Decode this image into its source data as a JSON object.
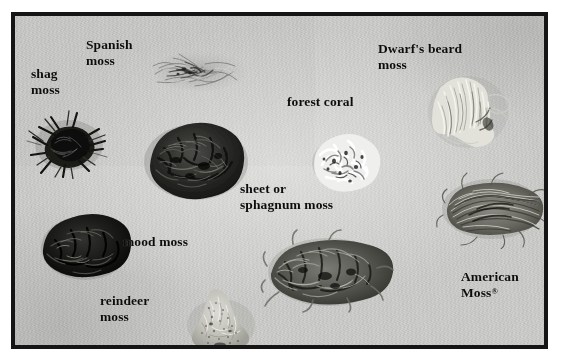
{
  "image": {
    "kind": "photograph",
    "subject": "labeled moss and preserved botanical specimens on a grey board",
    "frame_color": "#151515",
    "background_color": "#cdcdcb",
    "label_color": "#0d0d0d",
    "width": 562,
    "height": 364
  },
  "labels": [
    {
      "id": "spanish-moss",
      "text": "Spanish\nmoss"
    },
    {
      "id": "shag-moss",
      "text": "shag\nmoss"
    },
    {
      "id": "dwarfs-beard-moss",
      "text": "Dwarf's beard\nmoss"
    },
    {
      "id": "forest-coral",
      "text": "forest coral"
    },
    {
      "id": "sheet-sphagnum-moss",
      "text": "sheet or\nsphagnum moss"
    },
    {
      "id": "mood-moss",
      "text": "mood moss"
    },
    {
      "id": "reindeer-moss",
      "text": "reindeer\nmoss"
    },
    {
      "id": "american-moss",
      "text": "American\nMoss",
      "trademark": "®"
    }
  ],
  "specimens": [
    {
      "id": "spanish-moss-specimen",
      "tone": "light-grey wispy strands"
    },
    {
      "id": "shag-moss-specimen",
      "tone": "very dark spiky clump"
    },
    {
      "id": "dark-moss-specimen",
      "tone": "dark dense mound"
    },
    {
      "id": "forest-coral-specimen",
      "tone": "white branching coral-like lichen"
    },
    {
      "id": "dwarfs-beard-moss-specimen",
      "tone": "pale cream fibrous tuft"
    },
    {
      "id": "american-moss-specimen",
      "tone": "grey-brown tangled strands"
    },
    {
      "id": "sheet-sphagnum-moss-specimen",
      "tone": "medium grey shaggy mat"
    },
    {
      "id": "mood-moss-specimen",
      "tone": "near-black dense cushion"
    },
    {
      "id": "reindeer-moss-specimen",
      "tone": "pale speckled granular mound"
    }
  ]
}
